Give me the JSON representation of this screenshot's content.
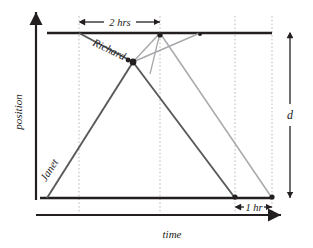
{
  "figure": {
    "type": "position-time-diagram",
    "title": "",
    "axes": {
      "x_label": "time",
      "y_label": "position",
      "x_axis": {
        "name": "time-axis",
        "from": [
          36,
          215
        ],
        "to": [
          283,
          215
        ],
        "arrow": "end"
      },
      "y_axis": {
        "name": "position-axis",
        "from": [
          36,
          200
        ],
        "to": [
          36,
          10
        ],
        "arrow": "end"
      }
    },
    "reference_lines": {
      "top_line": {
        "name": "top-boundary-line",
        "y": 33,
        "x_from": 47,
        "x_to": 272,
        "color": "#231f20"
      },
      "bottom_line": {
        "name": "bottom-boundary-line",
        "y": 198,
        "x_from": 40,
        "x_to": 272,
        "color": "#231f20"
      }
    },
    "gridlines": [
      {
        "name": "gridline-1",
        "x": 79
      },
      {
        "name": "gridline-2",
        "x": 160
      },
      {
        "name": "gridline-3",
        "x": 235
      },
      {
        "name": "gridline-4",
        "x": 272
      }
    ],
    "paths": [
      {
        "name": "richard-outbound-path",
        "person": "Richard",
        "color": "#58595b",
        "points": [
          [
            79,
            33
          ],
          [
            133,
            62
          ]
        ]
      },
      {
        "name": "richard-return-path",
        "person": "Richard",
        "color": "#58595b",
        "points": [
          [
            133,
            62
          ],
          [
            235,
            198
          ]
        ]
      },
      {
        "name": "janet-outbound-path",
        "person": "Janet",
        "color": "#58595b",
        "points": [
          [
            47,
            198
          ],
          [
            133,
            62
          ]
        ]
      },
      {
        "name": "secondary-path-a",
        "person": "",
        "color": "#a7a9ac",
        "points": [
          [
            133,
            62
          ],
          [
            160,
            33
          ]
        ]
      },
      {
        "name": "secondary-path-b",
        "person": "",
        "color": "#a7a9ac",
        "points": [
          [
            160,
            33
          ],
          [
            272,
            198
          ]
        ]
      },
      {
        "name": "secondary-path-c",
        "person": "",
        "color": "#a7a9ac",
        "points": [
          [
            133,
            62
          ],
          [
            200,
            33
          ]
        ]
      },
      {
        "name": "secondary-path-d",
        "person": "",
        "color": "#a7a9ac",
        "points": [
          [
            160,
            33
          ],
          [
            133,
            62
          ]
        ]
      }
    ],
    "markers": [
      {
        "name": "marker-crossing-point",
        "x": 133,
        "y": 62,
        "size": 3.4
      },
      {
        "name": "marker-top-mid",
        "x": 160,
        "y": 33,
        "size": 2.6
      },
      {
        "name": "marker-top-right",
        "x": 200,
        "y": 33,
        "size": 2.2
      },
      {
        "name": "marker-bottom-left-end",
        "x": 235,
        "y": 198,
        "size": 2.6
      },
      {
        "name": "marker-bottom-right-end",
        "x": 272,
        "y": 198,
        "size": 2.6
      }
    ],
    "annotations": {
      "duration_top": {
        "label": "2 hrs",
        "name": "two-hours-annotation",
        "x_from": 79,
        "x_to": 161,
        "y": 22
      },
      "duration_bottom": {
        "label": "1 hr",
        "name": "one-hour-annotation",
        "x_from": 235,
        "x_to": 272,
        "y": 207
      },
      "distance": {
        "label": "d",
        "name": "distance-annotation",
        "x": 290,
        "y_from": 33,
        "y_to": 198
      },
      "person_labels": [
        {
          "name": "richard-label",
          "label": "Richard",
          "x": 92,
          "y": 45,
          "rotate": 26
        },
        {
          "name": "janet-label",
          "label": "Janet",
          "x": 46,
          "y": 182,
          "rotate": -58
        }
      ]
    },
    "colors": {
      "ink": "#231f20",
      "dark_line": "#58595b",
      "light_line": "#a7a9ac",
      "gridline": "#bcb9b4",
      "background": "#ffffff"
    }
  }
}
